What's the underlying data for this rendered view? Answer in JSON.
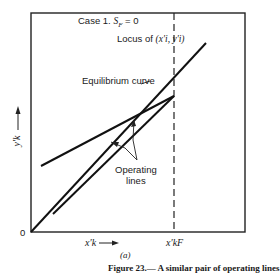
{
  "figure": {
    "case_label": "Case 1.",
    "case_condition_symbol": "S",
    "case_condition_sub": "F",
    "case_condition_value": "= 0",
    "locus_label": "Locus of",
    "locus_coords": "(x′i, y′i)",
    "equilibrium_label": "Equilibrium curve",
    "operating_label_line1": "Operating",
    "operating_label_line2": "lines",
    "y_axis_label": "y′k",
    "x_axis_label": "x′k",
    "x_axis_arrow": "⟶",
    "origin_label": "0",
    "x_feed_label": "x′kF",
    "subfigure_label": "(a)",
    "caption_fragment": "Figure 23.— A similar pair of operating lines"
  }
}
